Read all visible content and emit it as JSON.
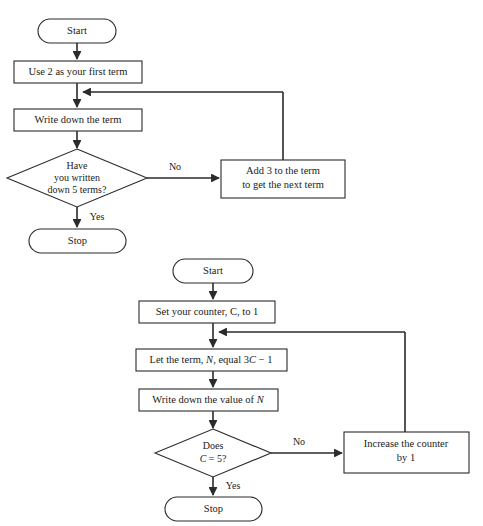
{
  "document": {
    "title": "Two flowcharts for generating number sequences",
    "background_color": "#ffffff",
    "line_color": "#2b2b2b",
    "text_color": "#1a1a1a"
  },
  "flowchart_top": {
    "name": "arithmetic-sequence-add-3-flowchart",
    "nodes": {
      "start": {
        "label": "Start",
        "shape": "terminator"
      },
      "first_term": {
        "label": "Use 2 as your first term",
        "shape": "process"
      },
      "write_term": {
        "label": "Write down the term",
        "shape": "process"
      },
      "decision": {
        "shape": "decision",
        "line1": "Have",
        "line2": "you written",
        "line3": "down 5 terms?"
      },
      "add_three": {
        "shape": "process",
        "line1": "Add 3 to the term",
        "line2": "to get the next term"
      },
      "stop": {
        "label": "Stop",
        "shape": "terminator"
      }
    },
    "edge_labels": {
      "no": "No",
      "yes": "Yes"
    }
  },
  "flowchart_bottom": {
    "name": "counter-formula-3c-minus-1-flowchart",
    "nodes": {
      "start": {
        "label": "Start",
        "shape": "terminator"
      },
      "set_counter": {
        "label": "Set your counter, C, to 1",
        "shape": "process"
      },
      "let_term": {
        "shape": "process",
        "prefix": "Let the term, ",
        "var_n": "N",
        "middle": ", equal 3",
        "var_c": "C",
        "suffix": " − 1"
      },
      "write_value": {
        "shape": "process",
        "prefix": "Write down the value of ",
        "var_n": "N"
      },
      "decision": {
        "shape": "decision",
        "line1": "Does",
        "var_c": "C",
        "line2_rest": " = 5?"
      },
      "increase": {
        "shape": "process",
        "line1": "Increase the counter",
        "line2": "by 1"
      },
      "stop": {
        "label": "Stop",
        "shape": "terminator"
      }
    },
    "edge_labels": {
      "no": "No",
      "yes": "Yes"
    }
  }
}
